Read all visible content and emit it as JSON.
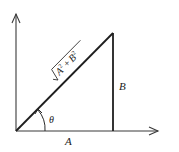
{
  "diagram": {
    "type": "right-triangle-vector",
    "labels": {
      "hypotenuse": "√(A² + B²)",
      "hypotenuse_radicand_a": "A",
      "hypotenuse_radicand_b": "B",
      "hypotenuse_exponent": "2",
      "hypotenuse_plus": "+",
      "vertical_side": "B",
      "horizontal_side": "A",
      "angle": "θ"
    },
    "colors": {
      "line": "#1e1e1e",
      "axis": "#3a3a3a",
      "background": "#ffffff"
    }
  }
}
